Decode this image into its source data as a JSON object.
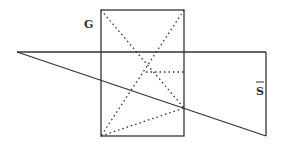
{
  "diagram": {
    "labels": {
      "g": "G",
      "s": "S"
    },
    "colors": {
      "stroke": "#333333",
      "background": "#ffffff"
    },
    "rectangle": {
      "x": 101,
      "y": 10,
      "width": 83,
      "height": 126
    },
    "solid_lines": [
      {
        "name": "horizontal-line",
        "x1": 17,
        "y1": 52,
        "x2": 266,
        "y2": 52
      },
      {
        "name": "right-vertical-line",
        "x1": 266,
        "y1": 52,
        "x2": 266,
        "y2": 136
      },
      {
        "name": "diagonal-line",
        "x1": 17,
        "y1": 52,
        "x2": 266,
        "y2": 136
      }
    ],
    "dotted_lines": [
      {
        "name": "dotted-top-left-to-right-mid",
        "x1": 101,
        "y1": 10,
        "x2": 184,
        "y2": 108
      },
      {
        "name": "dotted-top-right-to-bottom-left",
        "x1": 184,
        "y1": 10,
        "x2": 101,
        "y2": 136
      },
      {
        "name": "dotted-horizontal-inner",
        "x1": 146,
        "y1": 72,
        "x2": 184,
        "y2": 72
      },
      {
        "name": "dotted-bottom-left-to-right-mid",
        "x1": 101,
        "y1": 136,
        "x2": 184,
        "y2": 108
      }
    ]
  }
}
